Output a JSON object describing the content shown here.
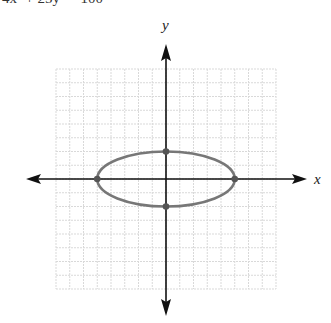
{
  "equation_text": "4x² + 25y² = 100",
  "chart_data": {
    "type": "line",
    "title": "",
    "xlabel": "x",
    "ylabel": "y",
    "xlim": [
      -8,
      8
    ],
    "ylim": [
      -8,
      8
    ],
    "grid": true,
    "grid_step": 1,
    "curve": {
      "kind": "ellipse",
      "equation": "4x^2 + 25y^2 = 100",
      "center": [
        0,
        0
      ],
      "semi_major_x": 5,
      "semi_minor_y": 2
    },
    "points": [
      {
        "x": -5,
        "y": 0
      },
      {
        "x": 5,
        "y": 0
      },
      {
        "x": 0,
        "y": 2
      },
      {
        "x": 0,
        "y": -2
      }
    ],
    "colors": {
      "grid": "#d9d9d9",
      "axis": "#111111",
      "curve": "#777777",
      "point": "#555555"
    }
  }
}
